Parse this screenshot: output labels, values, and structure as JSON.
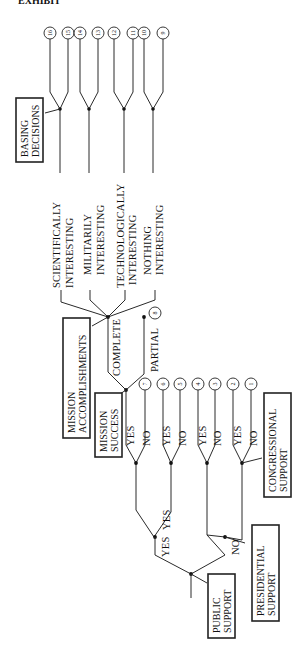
{
  "header": {
    "cropped_caption": "EXHIBIT"
  },
  "outcome_numbers": [
    "16",
    "15",
    "14",
    "13",
    "12",
    "11",
    "10",
    "9",
    "8",
    "7",
    "6",
    "5",
    "4",
    "3",
    "2",
    "1"
  ],
  "boxes": {
    "basing_decisions": [
      "BASING",
      "DECISIONS"
    ],
    "mission_accomplishments": [
      "MISSION",
      "ACCOMPLISHMENTS"
    ],
    "mission_success": [
      "MISSION",
      "SUCCESS"
    ],
    "congressional_support": [
      "CONGRESSIONAL",
      "SUPPORT"
    ],
    "presidential_support": [
      "PRESIDENTIAL",
      "SUPPORT"
    ],
    "public_support": [
      "PUBLIC",
      "SUPPORT"
    ]
  },
  "accomplishment_labels": [
    [
      "SCIENTIFICALLY",
      "INTERESTING"
    ],
    [
      "MILITARILY",
      "INTERESTING"
    ],
    [
      "TECHNOLOGICALLY",
      "INTERESTING"
    ],
    [
      "NOTHING",
      "INTERESTING"
    ]
  ],
  "branch_labels": {
    "complete": "COMPLETE",
    "partial": "PARTIAL",
    "yes": "YES",
    "no": "NO"
  }
}
